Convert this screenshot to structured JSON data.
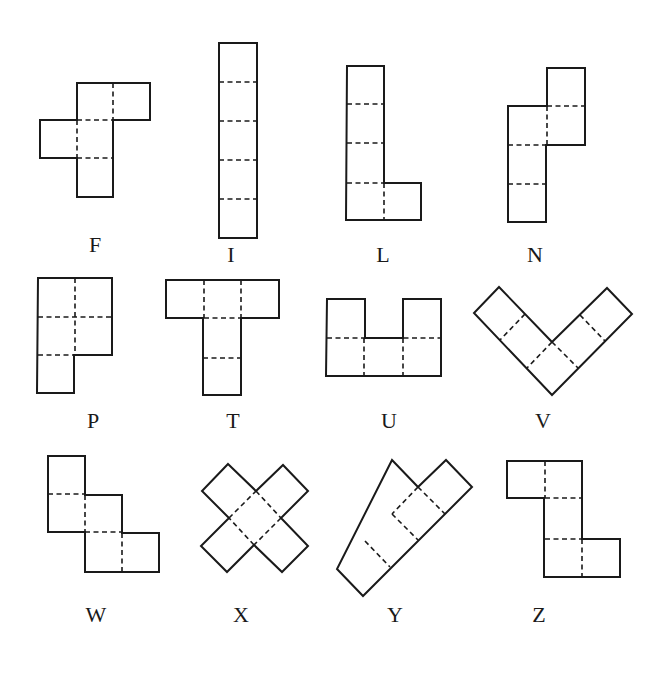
{
  "pieces": [
    {
      "name": "F",
      "label": "F",
      "label_pos": [
        95,
        252
      ],
      "outline": "77,83 150,83 150,120 113,120 113,197 77,197 77,158 40,158 40,120 77,120 Z",
      "folds": [
        "M113,83 L113,120",
        "M77,120 L113,120",
        "M77,120 L77,158",
        "M77,158 L113,158"
      ]
    },
    {
      "name": "I",
      "label": "I",
      "label_pos": [
        231,
        262
      ],
      "outline": "219,43 257,43 257,238 219,238 Z",
      "folds": [
        "M219,82 L257,82",
        "M219,121 L257,121",
        "M219,160 L257,160",
        "M219,199 L257,199"
      ]
    },
    {
      "name": "L",
      "label": "L",
      "label_pos": [
        383,
        262
      ],
      "outline": "347,66 384,66 384,183 421,183 421,220 346,220 Z",
      "folds": [
        "M347,104 L384,104",
        "M347,143 L384,143",
        "M347,183 L384,183",
        "M384,183 L384,220"
      ]
    },
    {
      "name": "N",
      "label": "N",
      "label_pos": [
        535,
        262
      ],
      "outline": "547,68 585,68 585,145 546,145 546,222 508,222 508,106 547,106 Z",
      "folds": [
        "M547,106 L585,106",
        "M547,106 L547,145",
        "M508,145 L547,145",
        "M508,184 L546,184"
      ]
    },
    {
      "name": "P",
      "label": "P",
      "label_pos": [
        93,
        428
      ],
      "outline": "38,278 112,278 112,355 74,355 74,393 37,393 Z",
      "folds": [
        "M75,278 L75,355",
        "M38,317 L112,317",
        "M38,355 L74,355"
      ]
    },
    {
      "name": "T",
      "label": "T",
      "label_pos": [
        233,
        428
      ],
      "outline": "166,280 279,280 279,318 241,318 241,395 203,395 203,318 166,318 Z",
      "folds": [
        "M204,280 L204,318",
        "M241,280 L241,318",
        "M204,318 L241,318",
        "M203,358 L241,358"
      ]
    },
    {
      "name": "U",
      "label": "U",
      "label_pos": [
        389,
        428
      ],
      "outline": "327,299 365,299 365,338 403,338 403,299 441,299 441,376 326,376 Z",
      "folds": [
        "M327,338 L441,338",
        "M364,338 L364,376",
        "M403,338 L403,376"
      ]
    },
    {
      "name": "V",
      "label": "V",
      "label_pos": [
        543,
        428
      ],
      "outline": "499,287 552,342 607,288 632,314 552,395 474,313 Z",
      "folds": [
        "M525,314 L500,340",
        "M552,342 L527,368",
        "M580,315 L605,341",
        "M552,342 L578,368"
      ]
    },
    {
      "name": "W",
      "label": "W",
      "label_pos": [
        96,
        622
      ],
      "outline": "48,456 85,456 85,495 122,495 122,533 159,533 159,572 85,572 85,532 48,532 Z",
      "folds": [
        "M48,494 L85,494",
        "M85,495 L85,532",
        "M85,532 L122,532",
        "M122,533 L122,572"
      ]
    },
    {
      "name": "X",
      "label": "X",
      "label_pos": [
        241,
        622
      ],
      "outline": "228,464 256,491 283,465 308,491 281,518 308,546 282,572 254,545 227,572 201,546 229,518 202,491 Z",
      "folds": [
        "M256,491 L281,518",
        "M281,518 L254,545",
        "M254,545 L229,518",
        "M229,518 L256,491"
      ]
    },
    {
      "name": "Y",
      "label": "Y",
      "label_pos": [
        395,
        622
      ],
      "outline": "392,460 418,487 446,460 472,487 363,596 337,569 Z",
      "folds": [
        "M418,487 L445,514",
        "M418,487 L392,514",
        "M392,514 L418,540",
        "M365,541 L390,567"
      ]
    },
    {
      "name": "Z",
      "label": "Z",
      "label_pos": [
        539,
        622
      ],
      "outline": "507,461 582,461 582,539 620,539 620,577 544,577 544,498 507,498 Z",
      "folds": [
        "M545,461 L545,498",
        "M545,498 L582,498",
        "M545,539 L582,539",
        "M582,539 L582,577"
      ]
    }
  ],
  "colors": {
    "line": "#1a1a1a",
    "background": "#ffffff"
  }
}
